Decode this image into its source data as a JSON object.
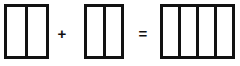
{
  "diagram": {
    "type": "unit-bar-addition",
    "equation_text": "2 + 2 = 4",
    "stroke_color": "#111111",
    "fill_color": "#ffffff",
    "canvas": {
      "width": 240,
      "height": 66
    },
    "operators": [
      {
        "name": "plus",
        "symbol": "+",
        "x": 62,
        "y": 33
      },
      {
        "name": "equals",
        "symbol": "=",
        "x": 143,
        "y": 33
      }
    ],
    "bars": [
      {
        "id": "addend-1",
        "label": "first addend bar",
        "cells": 2,
        "x": 4,
        "y": 4,
        "width": 45,
        "height": 55
      },
      {
        "id": "addend-2",
        "label": "second addend bar",
        "cells": 2,
        "x": 84,
        "y": 4,
        "width": 40,
        "height": 55
      },
      {
        "id": "sum",
        "label": "sum bar",
        "cells": 4,
        "x": 160,
        "y": 4,
        "width": 75,
        "height": 55
      }
    ]
  }
}
